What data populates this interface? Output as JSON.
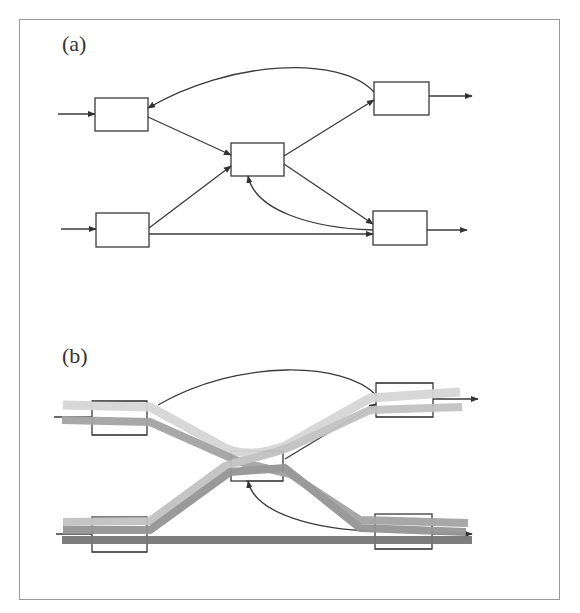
{
  "figure": {
    "panels": [
      {
        "id": "a",
        "label": "(a)",
        "nodes": [
          {
            "id": "in-top",
            "x": 95,
            "y": 98,
            "w": 53,
            "h": 33
          },
          {
            "id": "in-bottom",
            "x": 96,
            "y": 213,
            "w": 53,
            "h": 34
          },
          {
            "id": "center",
            "x": 231,
            "y": 143,
            "w": 53,
            "h": 33
          },
          {
            "id": "out-top",
            "x": 374,
            "y": 82,
            "w": 55,
            "h": 33
          },
          {
            "id": "out-bottom",
            "x": 373,
            "y": 211,
            "w": 54,
            "h": 34
          }
        ],
        "edges": [
          {
            "from": "external",
            "to": "in-top",
            "type": "input"
          },
          {
            "from": "external",
            "to": "in-bottom",
            "type": "input"
          },
          {
            "from": "in-top",
            "to": "center",
            "type": "straight"
          },
          {
            "from": "in-bottom",
            "to": "center",
            "type": "straight"
          },
          {
            "from": "in-bottom",
            "to": "out-bottom",
            "type": "straight"
          },
          {
            "from": "center",
            "to": "out-top",
            "type": "straight"
          },
          {
            "from": "center",
            "to": "out-bottom",
            "type": "straight"
          },
          {
            "from": "out-top",
            "to": "in-top",
            "type": "feedback-curve"
          },
          {
            "from": "out-bottom",
            "to": "center",
            "type": "feedback-curve"
          },
          {
            "from": "out-top",
            "to": "external",
            "type": "output"
          },
          {
            "from": "out-bottom",
            "to": "external",
            "type": "output"
          }
        ]
      },
      {
        "id": "b",
        "label": "(b)",
        "nodes": [
          {
            "id": "in-top",
            "x": 92,
            "y": 401,
            "w": 55,
            "h": 34
          },
          {
            "id": "in-bottom",
            "x": 92,
            "y": 517,
            "w": 55,
            "h": 35
          },
          {
            "id": "center",
            "x": 231,
            "y": 451,
            "w": 52,
            "h": 30
          },
          {
            "id": "out-top",
            "x": 376,
            "y": 383,
            "w": 57,
            "h": 34
          },
          {
            "id": "out-bottom",
            "x": 375,
            "y": 514,
            "w": 57,
            "h": 35
          }
        ],
        "flow_bands": [
          {
            "name": "light-band-top",
            "color": "#d8d8d8"
          },
          {
            "name": "mid-band-top",
            "color": "#a8a8a8"
          },
          {
            "name": "light-band-bottom",
            "color": "#c4c4c4"
          },
          {
            "name": "mid-band-bottom",
            "color": "#9a9a9a"
          },
          {
            "name": "dark-band-straight",
            "color": "#7a7a7a"
          }
        ]
      }
    ]
  },
  "colors": {
    "line": "#3a3a3a",
    "frame": "#9a9a9a",
    "band_light": "#d8d8d8",
    "band_mid_light": "#c4c4c4",
    "band_mid": "#a6a6a6",
    "band_mid_dark": "#959595",
    "band_dark": "#7a7a7a"
  }
}
